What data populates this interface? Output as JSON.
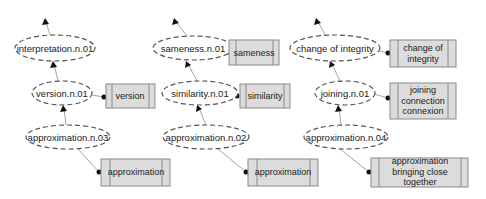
{
  "diagram": {
    "type": "wordnet-hypernym-graph",
    "columns": [
      {
        "synsets": [
          {
            "id": "interpretation",
            "label": "interpretation.n.01"
          },
          {
            "id": "version",
            "label": "version.n.01",
            "lemmas": "version"
          },
          {
            "id": "approximation3",
            "label": "approximation.n.03",
            "lemmas": "approximation"
          }
        ]
      },
      {
        "synsets": [
          {
            "id": "sameness",
            "label": "sameness.n.01",
            "lemmas": "sameness"
          },
          {
            "id": "similarity",
            "label": "similarity.n.01",
            "lemmas": "similarity"
          },
          {
            "id": "approximation2",
            "label": "approximation.n.02",
            "lemmas": "approximation"
          }
        ]
      },
      {
        "synsets": [
          {
            "id": "change",
            "label": "change of integrity",
            "lemmas": "change of\nintegrity"
          },
          {
            "id": "joining",
            "label": "joining.n.01",
            "lemmas": "joining\nconnection\nconnexion"
          },
          {
            "id": "approximation4",
            "label": "approximation.n.04",
            "lemmas": "approximation\nbringing close together"
          }
        ]
      }
    ],
    "colors": {
      "box_fill": "#dcdcdc",
      "box_stroke": "#8a8a8a",
      "ellipse_stroke": "#555555",
      "edge": "#9a9a9a"
    }
  }
}
